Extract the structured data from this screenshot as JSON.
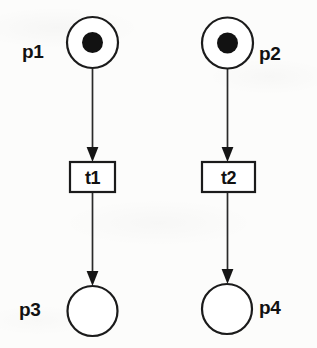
{
  "diagram": {
    "type": "petri-net",
    "width": 317,
    "height": 348,
    "background_color": "#fcfcfb",
    "stroke_color": "#1b1b1b",
    "token_color": "#121212"
  },
  "places": [
    {
      "id": "p1",
      "label": "p1",
      "tokens": 1,
      "cx": 92.5,
      "cy": 42.5,
      "r": 25.5,
      "label_x": 22,
      "label_y": 42,
      "label_side": "left"
    },
    {
      "id": "p2",
      "label": "p2",
      "tokens": 1,
      "cx": 227.5,
      "cy": 43,
      "r": 25.5,
      "label_x": 259,
      "label_y": 44,
      "label_side": "right"
    },
    {
      "id": "p3",
      "label": "p3",
      "tokens": 0,
      "cx": 92.5,
      "cy": 311,
      "r": 25.0,
      "label_x": 19,
      "label_y": 300,
      "label_side": "left"
    },
    {
      "id": "p4",
      "label": "p4",
      "tokens": 0,
      "cx": 227,
      "cy": 309,
      "r": 25.0,
      "label_x": 259,
      "label_y": 298,
      "label_side": "right"
    }
  ],
  "transitions": [
    {
      "id": "t1",
      "label": "t1",
      "x": 70,
      "y": 162,
      "width": 45,
      "height": 30
    },
    {
      "id": "t2",
      "label": "t2",
      "x": 202,
      "y": 162,
      "width": 53,
      "height": 30
    }
  ],
  "arcs": [
    {
      "id": "a1",
      "from": "p1",
      "to": "t1",
      "x": 92.5,
      "y1": 69,
      "y2": 161
    },
    {
      "id": "a2",
      "from": "t1",
      "to": "p3",
      "x": 92.5,
      "y1": 192,
      "y2": 285
    },
    {
      "id": "a3",
      "from": "p2",
      "to": "t2",
      "x": 227.5,
      "y1": 69,
      "y2": 161
    },
    {
      "id": "a4",
      "from": "t2",
      "to": "p4",
      "x": 227.5,
      "y1": 192,
      "y2": 283
    }
  ]
}
